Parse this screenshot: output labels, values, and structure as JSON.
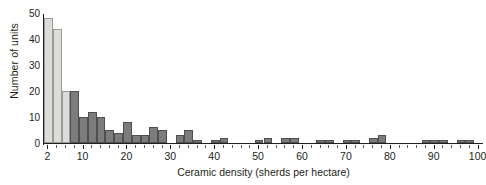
{
  "chart_data": {
    "type": "bar",
    "title": "",
    "subtitle": "",
    "xlabel": "Ceramic density (sherds per hectare)",
    "ylabel": "Number of units",
    "xlim": [
      1,
      101
    ],
    "ylim": [
      0,
      50
    ],
    "grid": false,
    "legend": null,
    "bin_width": 2,
    "xtick_labels": [
      "2",
      "10",
      "20",
      "30",
      "40",
      "50",
      "60",
      "70",
      "80",
      "90",
      "100"
    ],
    "xtick_values": [
      2,
      10,
      20,
      30,
      40,
      50,
      60,
      70,
      80,
      90,
      100
    ],
    "ytick_labels": [
      "0",
      "10",
      "20",
      "30",
      "40",
      "50"
    ],
    "ytick_values": [
      0,
      10,
      20,
      30,
      40,
      50
    ],
    "highlight_color": "#dcdcd8",
    "bar_color": "#7c7c7c",
    "axis_color": "#231f20",
    "note": "Histogram of ceramic density; first two bins drawn in light grey, remaining bins dark grey.",
    "bins": [
      {
        "x": 2,
        "value": 48,
        "shade": "light"
      },
      {
        "x": 4,
        "value": 44,
        "shade": "light"
      },
      {
        "x": 6,
        "value": 20,
        "shade": "light"
      },
      {
        "x": 8,
        "value": 20,
        "shade": "dark"
      },
      {
        "x": 10,
        "value": 10,
        "shade": "dark"
      },
      {
        "x": 12,
        "value": 12,
        "shade": "dark"
      },
      {
        "x": 14,
        "value": 10,
        "shade": "dark"
      },
      {
        "x": 16,
        "value": 5,
        "shade": "dark"
      },
      {
        "x": 18,
        "value": 4,
        "shade": "dark"
      },
      {
        "x": 20,
        "value": 8,
        "shade": "dark"
      },
      {
        "x": 22,
        "value": 3,
        "shade": "dark"
      },
      {
        "x": 24,
        "value": 3,
        "shade": "dark"
      },
      {
        "x": 26,
        "value": 6,
        "shade": "dark"
      },
      {
        "x": 28,
        "value": 5,
        "shade": "dark"
      },
      {
        "x": 30,
        "value": 0,
        "shade": "dark"
      },
      {
        "x": 32,
        "value": 3,
        "shade": "dark"
      },
      {
        "x": 34,
        "value": 5,
        "shade": "dark"
      },
      {
        "x": 36,
        "value": 1,
        "shade": "dark"
      },
      {
        "x": 38,
        "value": 0,
        "shade": "dark"
      },
      {
        "x": 40,
        "value": 1,
        "shade": "dark"
      },
      {
        "x": 42,
        "value": 2,
        "shade": "dark"
      },
      {
        "x": 44,
        "value": 0,
        "shade": "dark"
      },
      {
        "x": 46,
        "value": 0,
        "shade": "dark"
      },
      {
        "x": 48,
        "value": 0,
        "shade": "dark"
      },
      {
        "x": 50,
        "value": 1,
        "shade": "dark"
      },
      {
        "x": 52,
        "value": 2,
        "shade": "dark"
      },
      {
        "x": 54,
        "value": 0,
        "shade": "dark"
      },
      {
        "x": 56,
        "value": 2,
        "shade": "dark"
      },
      {
        "x": 58,
        "value": 2,
        "shade": "dark"
      },
      {
        "x": 60,
        "value": 0,
        "shade": "dark"
      },
      {
        "x": 62,
        "value": 0,
        "shade": "dark"
      },
      {
        "x": 64,
        "value": 1,
        "shade": "dark"
      },
      {
        "x": 66,
        "value": 1,
        "shade": "dark"
      },
      {
        "x": 68,
        "value": 0,
        "shade": "dark"
      },
      {
        "x": 70,
        "value": 1,
        "shade": "dark"
      },
      {
        "x": 72,
        "value": 1,
        "shade": "dark"
      },
      {
        "x": 74,
        "value": 0,
        "shade": "dark"
      },
      {
        "x": 76,
        "value": 2,
        "shade": "dark"
      },
      {
        "x": 78,
        "value": 3,
        "shade": "dark"
      },
      {
        "x": 80,
        "value": 0,
        "shade": "dark"
      },
      {
        "x": 82,
        "value": 0,
        "shade": "dark"
      },
      {
        "x": 84,
        "value": 0,
        "shade": "dark"
      },
      {
        "x": 86,
        "value": 0,
        "shade": "dark"
      },
      {
        "x": 88,
        "value": 1,
        "shade": "dark"
      },
      {
        "x": 90,
        "value": 1,
        "shade": "dark"
      },
      {
        "x": 92,
        "value": 1,
        "shade": "dark"
      },
      {
        "x": 94,
        "value": 0,
        "shade": "dark"
      },
      {
        "x": 96,
        "value": 1,
        "shade": "dark"
      },
      {
        "x": 98,
        "value": 1,
        "shade": "dark"
      },
      {
        "x": 100,
        "value": 0,
        "shade": "dark"
      }
    ]
  }
}
